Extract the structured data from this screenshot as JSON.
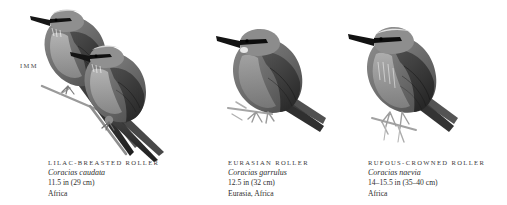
{
  "plate": {
    "age_label": "IMM",
    "background": "#ffffff",
    "ink": "#2b2b2b"
  },
  "species": [
    {
      "common_name": "LILAC-BREASTED ROLLER",
      "scientific_name": "Coracias caudata",
      "size": "11.5 in (29 cm)",
      "range": "Africa",
      "figure_name": "lilac-breasted-roller-illustration",
      "individuals": 2
    },
    {
      "common_name": "EURASIAN ROLLER",
      "scientific_name": "Coracias garrulus",
      "size": "12.5 in (32 cm)",
      "range": "Eurasia, Africa",
      "figure_name": "eurasian-roller-illustration",
      "individuals": 1
    },
    {
      "common_name": "RUFOUS-CROWNED ROLLER",
      "scientific_name": "Coracias naevia",
      "size": "14–15.5 in (35–40 cm)",
      "range": "Africa",
      "figure_name": "rufous-crowned-roller-illustration",
      "individuals": 1
    }
  ]
}
